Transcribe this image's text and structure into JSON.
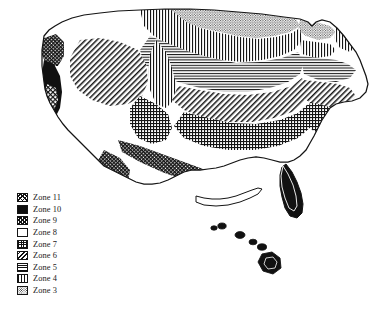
{
  "figure": {
    "type": "thematic-map",
    "region": "Continental United States with Hawaii",
    "style": "black-and-white hatch-pattern cartogram",
    "background_color": "#ffffff",
    "line_color": "#141414"
  },
  "legend": {
    "name": "zone-legend",
    "position": "lower-left",
    "rows": [
      {
        "label": "Zone 11",
        "pattern": "crosshatch-fine",
        "swatch_name": "swatch-zone-11"
      },
      {
        "label": "Zone 10",
        "pattern": "solid",
        "swatch_name": "swatch-zone-10"
      },
      {
        "label": "Zone 9",
        "pattern": "crosshatch-dense",
        "swatch_name": "swatch-zone-9"
      },
      {
        "label": "Zone 8",
        "pattern": "blank",
        "swatch_name": "swatch-zone-8"
      },
      {
        "label": "Zone 7",
        "pattern": "crosshatch-grid",
        "swatch_name": "swatch-zone-7"
      },
      {
        "label": "Zone 6",
        "pattern": "diagonal",
        "swatch_name": "swatch-zone-6"
      },
      {
        "label": "Zone 5",
        "pattern": "horizontal",
        "swatch_name": "swatch-zone-5"
      },
      {
        "label": "Zone 4",
        "pattern": "vertical",
        "swatch_name": "swatch-zone-4"
      },
      {
        "label": "Zone 3",
        "pattern": "stipple",
        "swatch_name": "swatch-zone-3"
      }
    ]
  },
  "map_regions": [
    {
      "name": "pacific-northwest-coast",
      "zone": "Zone 9",
      "pattern": "crosshatch-dense"
    },
    {
      "name": "pacific-coast-strip",
      "zone": "Zone 10",
      "pattern": "solid"
    },
    {
      "name": "southern-california",
      "zone": "Zone 11",
      "pattern": "crosshatch-fine"
    },
    {
      "name": "northern-rockies",
      "zone": "Zone 4",
      "pattern": "vertical"
    },
    {
      "name": "northern-plains",
      "zone": "Zone 3",
      "pattern": "stipple"
    },
    {
      "name": "great-basin",
      "zone": "Zone 6",
      "pattern": "diagonal"
    },
    {
      "name": "central-plains",
      "zone": "Zone 5",
      "pattern": "horizontal"
    },
    {
      "name": "ohio-valley",
      "zone": "Zone 6",
      "pattern": "diagonal"
    },
    {
      "name": "mid-atlantic",
      "zone": "Zone 7",
      "pattern": "crosshatch-grid"
    },
    {
      "name": "southeast-interior",
      "zone": "Zone 8",
      "pattern": "blank"
    },
    {
      "name": "gulf-coast",
      "zone": "Zone 9",
      "pattern": "crosshatch-dense"
    },
    {
      "name": "south-texas",
      "zone": "Zone 9",
      "pattern": "crosshatch-dense"
    },
    {
      "name": "southern-florida",
      "zone": "Zone 10",
      "pattern": "solid"
    },
    {
      "name": "hawaii-islands",
      "zone": "Zone 11",
      "pattern": "solid"
    },
    {
      "name": "new-england",
      "zone": "Zone 5",
      "pattern": "horizontal"
    },
    {
      "name": "northern-maine",
      "zone": "Zone 4",
      "pattern": "vertical"
    }
  ]
}
